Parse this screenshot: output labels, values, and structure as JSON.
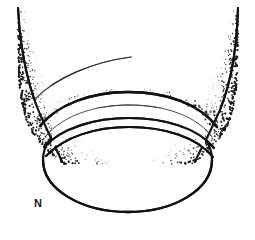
{
  "figure": {
    "kind": "stipple-line-drawing",
    "caption_label": "N",
    "background_color": "#ffffff",
    "ink_color": "#111111",
    "stipple_color": "#1a1a1a",
    "canvas": {
      "width": 255,
      "height": 231
    },
    "elements": {
      "left_wall_label": "left wall outline",
      "right_wall_label": "right wall outline",
      "rim_upper_label": "upper rim arc",
      "rim_middle_label": "middle rim arc",
      "rim_lower_label": "lower rim arc",
      "base_ellipse_label": "base ellipse",
      "highlight_label": "interior highlight stroke",
      "left_shading_label": "left stipple shading",
      "right_shading_label": "right stipple shading"
    },
    "geometry": {
      "left_wall": "M 18,8 C 20,46 27,88 44,123 C 52,141 58,152 62,162",
      "right_wall": "M 238,8 C 237,46 232,88 214,123 C 206,141 199,152 195,162",
      "rim_upper": "M 40,126 C 58,104 92,92 128,92 C 166,92 200,104 217,127",
      "rim_middle": "M 46,136 C 62,116 94,105 129,105 C 165,105 197,116 212,137",
      "rim_band_a": "M 44,147 C 62,128 94,118 129,118 C 165,118 198,128 214,148",
      "rim_band_b": "M 46,156 C 64,137 95,127 129,127 C 164,127 197,137 213,157",
      "base_ellipse": "M 43,160 C 43,189 81,212 128,212 C 175,212 212,189 212,160 C 212,131 175,110 128,110 C 81,110 43,131 43,160 Z",
      "highlight": "M 36,98 C 56,78 92,62 131,57"
    },
    "stipple": {
      "left_seed": 1337,
      "right_seed": 8461,
      "dot_count_left": 430,
      "dot_count_right": 380,
      "min_radius": 0.35,
      "max_radius": 1.15
    }
  }
}
